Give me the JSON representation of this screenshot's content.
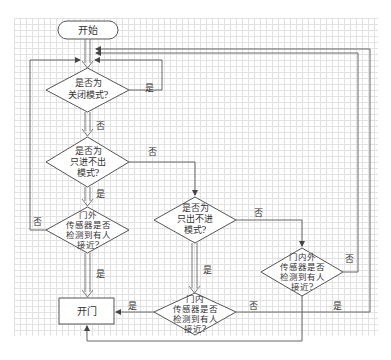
{
  "flowchart": {
    "start": "开始",
    "d1": [
      "是否为",
      "关闭模式?"
    ],
    "d2": [
      "是否为",
      "只进不出",
      "模式?"
    ],
    "d3": [
      "门外",
      "传感器是否",
      "检测到有人",
      "接近?"
    ],
    "d4": [
      "是否为",
      "只出不进",
      "模式?"
    ],
    "d5": [
      "门内",
      "传感器是否",
      "检测到有人",
      "接近?"
    ],
    "d6": [
      "门内外",
      "传感器是否",
      "检测到有人",
      "接近?"
    ],
    "open": "开门",
    "labels": {
      "d1_yes": "是",
      "d1_no": "否",
      "d2_no": "否",
      "d2_yes": "是",
      "d3_no": "否",
      "d3_yes": "是",
      "d4_no": "否",
      "d4_yes": "是",
      "d5_yes": "是",
      "d5_no": "否",
      "d6_no": "否",
      "d6_yes": "是"
    },
    "colors": {
      "line": "#555555",
      "grid": "#e2e2e2",
      "text": "#333333"
    }
  }
}
